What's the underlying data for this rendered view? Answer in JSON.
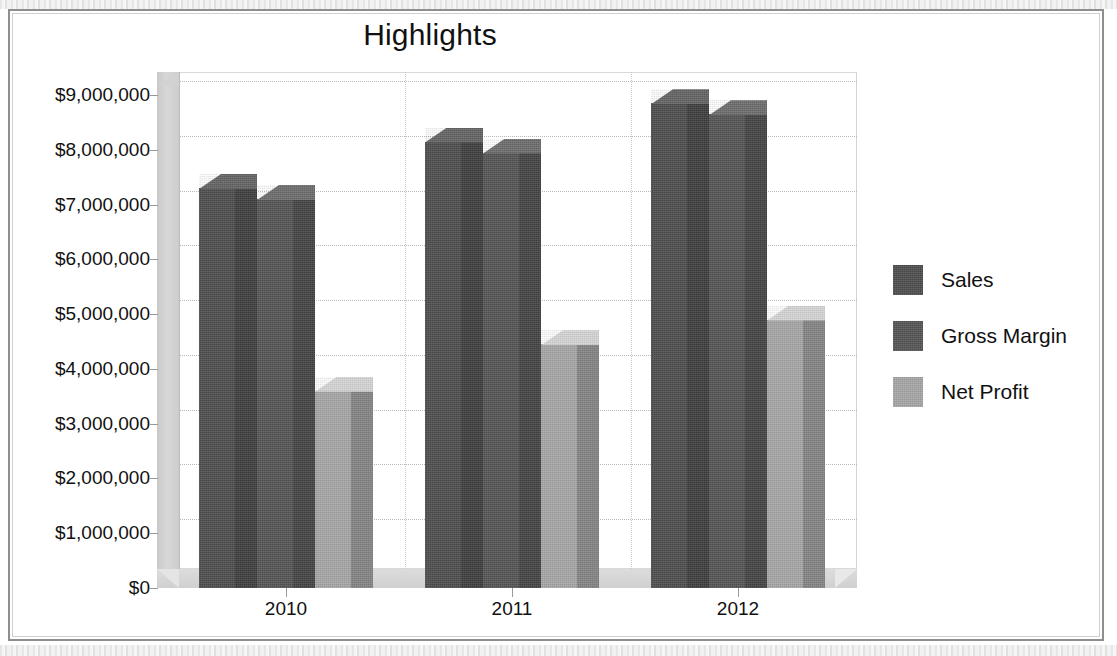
{
  "chart_data": {
    "type": "bar",
    "title": "Highlights",
    "xlabel": "",
    "ylabel": "",
    "categories": [
      "2010",
      "2011",
      "2012"
    ],
    "series": [
      {
        "name": "Sales",
        "color": "#4f4f4f",
        "values": [
          7300000,
          8150000,
          8850000
        ]
      },
      {
        "name": "Gross Margin",
        "color": "#565656",
        "values": [
          7100000,
          7950000,
          8650000
        ]
      },
      {
        "name": "Net Profit",
        "color": "#a8a8a8",
        "values": [
          3600000,
          4450000,
          4900000
        ]
      }
    ],
    "ylim": [
      0,
      9000000
    ],
    "ytick_values": [
      0,
      1000000,
      2000000,
      3000000,
      4000000,
      5000000,
      6000000,
      7000000,
      8000000,
      9000000
    ],
    "ytick_labels": [
      "$0",
      "$1,000,000",
      "$2,000,000",
      "$3,000,000",
      "$4,000,000",
      "$5,000,000",
      "$6,000,000",
      "$7,000,000",
      "$8,000,000",
      "$9,000,000"
    ],
    "grid": true,
    "legend_position": "right",
    "three_d": true
  },
  "colors": {
    "sales": "#4f4f4f",
    "gross_margin": "#565656",
    "net_profit": "#a8a8a8",
    "plot_background": "#ffffff",
    "wall": "#d2d2d2",
    "floor": "#d6d6d6",
    "gridline": "#b9b9b9",
    "frame": "#8e8e8e",
    "text": "#111111"
  }
}
